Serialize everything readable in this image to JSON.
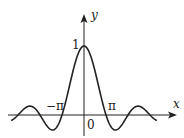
{
  "chart_data": {
    "type": "line",
    "title": "",
    "function": "y = sin(x)/x",
    "xlabel": "x",
    "ylabel": "y",
    "x_tick_labels": [
      "-π",
      "0",
      "π"
    ],
    "y_tick_labels": [
      "1"
    ],
    "xlim": [
      -10.4,
      10.4
    ],
    "ylim": [
      -0.3,
      1.2
    ],
    "grid": false,
    "legend": null,
    "series": [
      {
        "name": "sin(x)/x",
        "x": [
          -10.4,
          -9.42,
          -7.73,
          -6.28,
          -4.49,
          -3.14,
          -1.57,
          0,
          1.57,
          3.14,
          4.49,
          6.28,
          7.73,
          9.42,
          10.4
        ],
        "values": [
          -0.08,
          0,
          0.128,
          0,
          -0.217,
          0,
          0.637,
          1,
          0.637,
          0,
          -0.217,
          0,
          0.128,
          0,
          -0.08
        ]
      }
    ],
    "color": "#222222"
  },
  "labels": {
    "y_axis": "y",
    "x_axis": "x",
    "one": "1",
    "neg_pi": "−π",
    "pi": "π",
    "origin": "0"
  }
}
